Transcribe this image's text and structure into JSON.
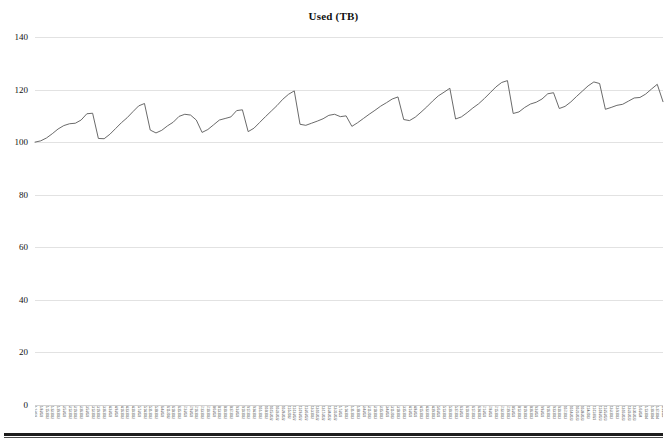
{
  "chart_data": {
    "type": "line",
    "title": "Used (TB)",
    "xlabel": "",
    "ylabel": "",
    "ylim": [
      0,
      140
    ],
    "yticks": [
      0,
      20,
      40,
      60,
      80,
      100,
      120,
      140
    ],
    "grid": true,
    "legend": false,
    "legend_position": "none",
    "line_color": "#595959",
    "line_width": 0.9,
    "background": "#ffffff",
    "gridline_color": "#e2e2e2",
    "x_tick_rotation": 90,
    "x_tick_note": "dense rotated date labels, one per sample",
    "series": [
      {
        "name": "Used (TB)",
        "values": [
          100.0,
          100.5,
          101.6,
          103.2,
          105.0,
          106.3,
          107.0,
          107.2,
          108.4,
          110.8,
          111.0,
          101.4,
          101.3,
          103.0,
          105.2,
          107.4,
          109.3,
          111.6,
          113.8,
          114.7,
          104.6,
          103.5,
          104.5,
          106.2,
          107.6,
          109.8,
          110.6,
          110.3,
          108.4,
          103.7,
          104.8,
          106.6,
          108.4,
          109.0,
          109.6,
          112.0,
          112.3,
          104.0,
          105.3,
          107.5,
          109.7,
          111.8,
          113.9,
          116.3,
          118.2,
          119.5,
          106.8,
          106.4,
          107.2,
          108.0,
          108.9,
          110.2,
          110.6,
          109.7,
          110.0,
          106.0,
          107.4,
          109.0,
          110.6,
          112.1,
          113.7,
          115.0,
          116.4,
          117.2,
          108.6,
          108.2,
          109.5,
          111.4,
          113.4,
          115.6,
          117.6,
          119.0,
          120.5,
          108.8,
          109.6,
          111.2,
          113.0,
          114.6,
          116.6,
          118.8,
          121.0,
          122.7,
          123.4,
          110.9,
          111.5,
          113.2,
          114.5,
          115.2,
          116.4,
          118.4,
          118.8,
          112.8,
          113.6,
          115.3,
          117.4,
          119.4,
          121.4,
          122.9,
          122.3,
          112.5,
          113.2,
          114.0,
          114.4,
          115.6,
          116.8,
          117.0,
          118.3,
          120.2,
          122.0,
          115.4
        ]
      }
    ],
    "x": [
      "1/1/2022",
      "1/8/2022",
      "1/15/2022",
      "1/22/2022",
      "1/29/2022",
      "2/5/2022",
      "2/12/2022",
      "2/19/2022",
      "2/26/2022",
      "3/5/2022",
      "3/12/2022",
      "3/19/2022",
      "3/26/2022",
      "4/2/2022",
      "4/9/2022",
      "4/16/2022",
      "4/23/2022",
      "4/30/2022",
      "5/7/2022",
      "5/14/2022",
      "5/21/2022",
      "5/28/2022",
      "6/4/2022",
      "6/11/2022",
      "6/18/2022",
      "6/25/2022",
      "7/2/2022",
      "7/9/2022",
      "7/16/2022",
      "7/23/2022",
      "7/30/2022",
      "8/6/2022",
      "8/13/2022",
      "8/20/2022",
      "8/27/2022",
      "9/3/2022",
      "9/10/2022",
      "9/17/2022",
      "9/24/2022",
      "10/1/2022",
      "10/8/2022",
      "10/15/2022",
      "10/22/2022",
      "10/29/2022",
      "11/5/2022",
      "11/12/2022",
      "11/19/2022",
      "11/26/2022",
      "12/3/2022",
      "12/10/2022",
      "12/17/2022",
      "12/24/2022",
      "12/31/2022",
      "1/7/2023",
      "1/14/2023",
      "1/21/2023",
      "1/28/2023",
      "2/4/2023",
      "2/11/2023",
      "2/18/2023",
      "2/25/2023",
      "3/4/2023",
      "3/11/2023",
      "3/18/2023",
      "3/25/2023",
      "4/1/2023",
      "4/8/2023",
      "4/15/2023",
      "4/22/2023",
      "4/29/2023",
      "5/6/2023",
      "5/13/2023",
      "5/20/2023",
      "5/27/2023",
      "6/3/2023",
      "6/10/2023",
      "6/17/2023",
      "6/24/2023",
      "7/1/2023",
      "7/8/2023",
      "7/15/2023",
      "7/22/2023",
      "7/29/2023",
      "8/5/2023",
      "8/12/2023",
      "8/19/2023",
      "8/26/2023",
      "9/2/2023",
      "9/9/2023",
      "9/16/2023",
      "9/23/2023",
      "9/30/2023",
      "10/7/2023",
      "10/14/2023",
      "10/21/2023",
      "10/28/2023",
      "11/4/2023",
      "11/11/2023",
      "11/18/2023",
      "11/25/2023",
      "12/2/2023",
      "12/9/2023",
      "12/16/2023",
      "12/23/2023",
      "12/30/2023",
      "1/6/2024",
      "1/13/2024",
      "1/20/2024",
      "1/27/2024",
      "2/3/2024"
    ]
  }
}
